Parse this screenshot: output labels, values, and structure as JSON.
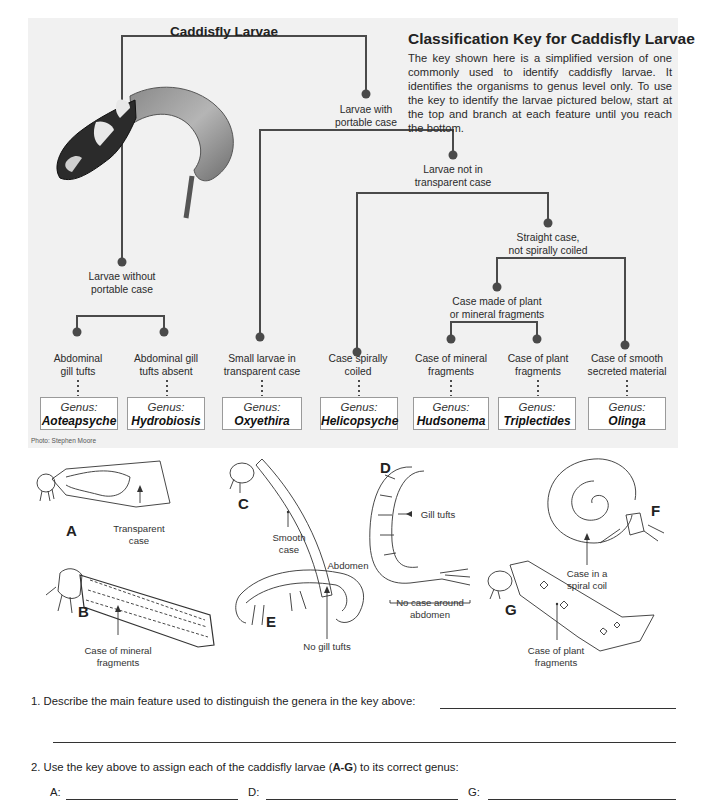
{
  "panel": {
    "root_title": "Caddisfly Larvae",
    "key_title": "Classification Key for Caddisfly Larvae",
    "intro": "The key shown here is a simplified version of one commonly used to identify caddisfly larvae. It identifies the organisms to genus level only. To use the key to identify the larvae pictured below, start at the top and branch at each feature until you reach the bottom.",
    "photo_credit": "Photo: Stephen Moore"
  },
  "key_nodes": {
    "with_case": [
      "Larvae with",
      "portable case"
    ],
    "without_case": [
      "Larvae without",
      "portable case"
    ],
    "not_transparent": [
      "Larvae not in",
      "transparent case"
    ],
    "straight_case": [
      "Straight case,",
      "not spirally coiled"
    ],
    "plant_or_mineral": [
      "Case made of plant",
      "or mineral fragments"
    ]
  },
  "leaves": [
    {
      "feature": [
        "Abdominal",
        "gill tufts"
      ],
      "genus_label": "Genus:",
      "genus": "Aoteapsyche"
    },
    {
      "feature": [
        "Abdominal gill",
        "tufts absent"
      ],
      "genus_label": "Genus:",
      "genus": "Hydrobiosis"
    },
    {
      "feature": [
        "Small larvae in",
        "transparent case"
      ],
      "genus_label": "Genus:",
      "genus": "Oxyethira"
    },
    {
      "feature": [
        "Case spirally",
        "coiled"
      ],
      "genus_label": "Genus:",
      "genus": "Helicopsyche"
    },
    {
      "feature": [
        "Case of mineral",
        "fragments"
      ],
      "genus_label": "Genus:",
      "genus": "Hudsonema"
    },
    {
      "feature": [
        "Case of plant",
        "fragments"
      ],
      "genus_label": "Genus:",
      "genus": "Triplectides"
    },
    {
      "feature": [
        "Case of smooth",
        "secreted material"
      ],
      "genus_label": "Genus:",
      "genus": "Olinga"
    }
  ],
  "figures": {
    "A": {
      "label": "A",
      "annotation": [
        "Transparent",
        "case"
      ]
    },
    "B": {
      "label": "B",
      "annotation": [
        "Case of mineral",
        "fragments"
      ]
    },
    "C": {
      "label": "C",
      "annotation": [
        "Smooth",
        "case"
      ]
    },
    "D": {
      "label": "D",
      "annotation": [
        "No case around",
        "abdomen"
      ],
      "annotation2": "Gill tufts"
    },
    "E": {
      "label": "E",
      "annotation": [
        "No gill tufts"
      ],
      "annotation2": "Abdomen"
    },
    "F": {
      "label": "F",
      "annotation": [
        "Case in a",
        "spiral coil"
      ]
    },
    "G": {
      "label": "G",
      "annotation": [
        "Case of plant",
        "fragments"
      ]
    }
  },
  "questions": {
    "q1": "1.  Describe the main feature used to distinguish the genera in the key above:",
    "q2_pre": "2.  Use the key above to assign each of the caddisfly larvae (",
    "q2_bold": "A-G",
    "q2_post": ") to its correct genus:",
    "answers": {
      "A": "A:",
      "B": "B:",
      "D": "D:",
      "E": "E:",
      "G": "G:"
    }
  }
}
